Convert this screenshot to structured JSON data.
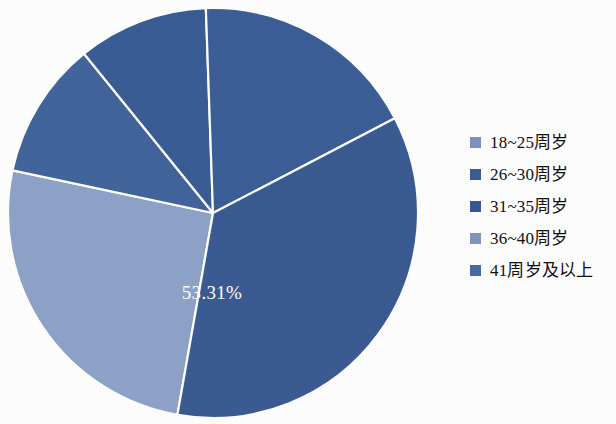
{
  "chart_data": {
    "type": "pie",
    "title": "",
    "xlabel": "",
    "ylabel": "",
    "legend_position": "right",
    "grid": false,
    "categories": [
      "18~25周岁",
      "26~30周岁",
      "31~35周岁",
      "36~40周岁",
      "41周岁及以上"
    ],
    "values": [
      25.56,
      10.83,
      10.3,
      53.31,
      0.0
    ],
    "labels": [
      "",
      "",
      "",
      "53.31%",
      ""
    ],
    "colors": [
      "#8fa3c8",
      "#3f6095",
      "#3b5998",
      "#3b5c92",
      "#4a6aa5"
    ],
    "series": [
      {
        "name": "年龄分布",
        "values": [
          25.56,
          10.83,
          10.3,
          53.31,
          0.0
        ]
      }
    ],
    "slices": [
      {
        "label": "18~25周岁",
        "value": 25.56,
        "color": "#8fa3c8",
        "start_angle": 190,
        "end_angle": 282,
        "data_label": ""
      },
      {
        "label": "26~30周岁",
        "value": 10.83,
        "color": "#42659c",
        "start_angle": 282,
        "end_angle": 321,
        "data_label": ""
      },
      {
        "label": "31~35周岁",
        "value": 10.3,
        "color": "#3a5d96",
        "start_angle": 321,
        "end_angle": 358,
        "data_label": ""
      },
      {
        "label": "36~40周岁",
        "value": 17.9,
        "color": "#3d5f97",
        "start_angle": 358,
        "end_angle": 422.5,
        "data_label": ""
      },
      {
        "label": "41周岁及以上",
        "value": 53.31,
        "color": "#3b5c92",
        "start_angle": 422.5,
        "end_angle": 550,
        "data_label": "53.31%"
      }
    ],
    "center": {
      "x": 213,
      "y": 213
    },
    "radius": 205,
    "data_label_text": "53.31%",
    "data_label_position": {
      "x": 212,
      "y": 295
    }
  },
  "legend": {
    "items": [
      {
        "label": "18~25周岁",
        "color": "#7e93c0"
      },
      {
        "label": "26~30周岁",
        "color": "#3c5c96"
      },
      {
        "label": "31~35周岁",
        "color": "#39589a"
      },
      {
        "label": "36~40周岁",
        "color": "#8296c2"
      },
      {
        "label": "41周岁及以上",
        "color": "#4a6aa5"
      }
    ]
  }
}
